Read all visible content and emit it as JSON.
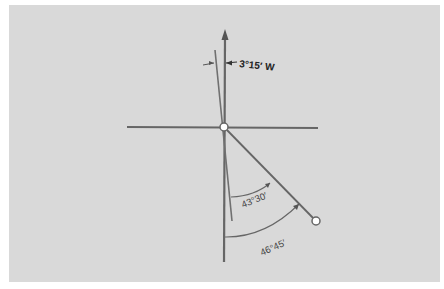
{
  "diagram": {
    "type": "bearing-declination",
    "background_color": "#d9d9d9",
    "line_color": "#666666",
    "labels": {
      "declination": "3°15′ W",
      "magnetic_angle": "43°30′",
      "true_angle": "46°45′"
    },
    "elements": {
      "true_north_line": "vertical line with arrow at top",
      "east_west_line": "horizontal line",
      "magnetic_north_line": "line offset 3°15′ west of true north",
      "bearing_line": "line from center to point with open circle",
      "center_point": "open circle",
      "end_point": "open circle"
    }
  }
}
